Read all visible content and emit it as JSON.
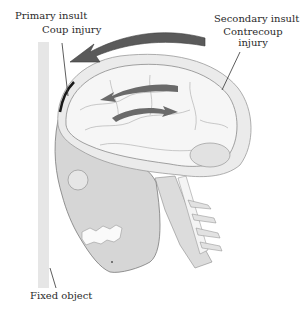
{
  "diagram": {
    "labels": {
      "primary_insult": "Primary insult",
      "coup_injury": "Coup injury",
      "secondary_insult": "Secondary insult",
      "contrecoup_line1": "Contrecoup",
      "contrecoup_line2": "injury",
      "fixed_object": "Fixed object"
    },
    "icons": [
      "rotation-arrow",
      "brain-motion-arrow-left",
      "brain-motion-arrow-right",
      "skull",
      "brain",
      "spine",
      "fixed-object-wall"
    ],
    "colors": {
      "arrow": "#5a5a5a",
      "skull": "#d4d4d4",
      "brain": "#efefef",
      "wall": "#e6e6e6",
      "line": "#333333"
    }
  }
}
